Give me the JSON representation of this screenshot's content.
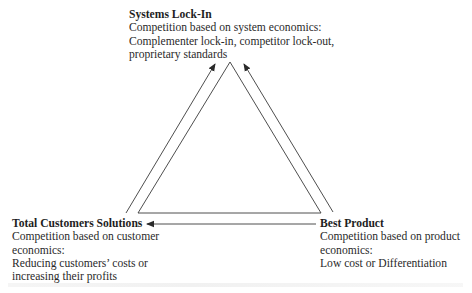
{
  "diagram": {
    "type": "triangle",
    "nodes": {
      "top": {
        "title": "Systems Lock-In",
        "lines": [
          "Competition based on system economics:",
          "Complementer lock-in, competitor lock-out,",
          "proprietary standards"
        ]
      },
      "left": {
        "title": "Total Customers Solutions",
        "lines": [
          "Competition based on customer",
          "economics:",
          "Reducing customers’ costs or",
          "increasing their profits"
        ]
      },
      "right": {
        "title": "Best Product",
        "lines": [
          "Competition based on product",
          "economics:",
          "Low cost or Differentiation"
        ]
      }
    },
    "edges": [
      {
        "from": "left",
        "to": "top",
        "arrow": "to"
      },
      {
        "from": "right",
        "to": "top",
        "arrow": "to"
      },
      {
        "from": "right",
        "to": "left",
        "arrow": "to"
      }
    ],
    "colors": {
      "line": "#3a3a3a",
      "text": "#2a2a2a"
    }
  }
}
